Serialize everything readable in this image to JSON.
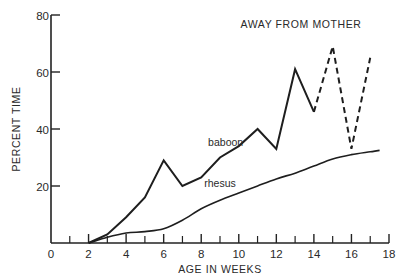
{
  "chart_data": {
    "type": "line",
    "title": "AWAY FROM MOTHER",
    "xlabel": "AGE IN WEEKS",
    "ylabel": "PERCENT TIME",
    "xlim": [
      0,
      18
    ],
    "ylim": [
      0,
      80
    ],
    "x_ticks": [
      0,
      2,
      4,
      6,
      8,
      10,
      12,
      14,
      16,
      18
    ],
    "x_minor_ticks": [
      1,
      3,
      5,
      7,
      9,
      11,
      13,
      15,
      17
    ],
    "y_ticks": [
      20,
      40,
      60,
      80
    ],
    "y_tick_labels": [
      "20",
      "40",
      "60",
      "80"
    ],
    "origin_label": "0",
    "grid": false,
    "legend": "inline labels",
    "series": [
      {
        "name": "baboon",
        "style": "solid then dashed after week 14",
        "x": [
          2,
          3,
          4,
          5,
          6,
          7,
          8,
          9,
          10,
          11,
          12,
          13,
          14,
          15,
          16,
          17
        ],
        "values": [
          0,
          3,
          9,
          16,
          29,
          20,
          23,
          30,
          34,
          40,
          33,
          61,
          46,
          69,
          33,
          65
        ],
        "solid_until_x": 14,
        "label_position": {
          "x": 9.3,
          "y": 34
        }
      },
      {
        "name": "rhesus",
        "style": "solid smooth",
        "x": [
          2,
          3,
          4,
          5,
          6,
          7,
          8,
          9,
          10,
          11,
          12,
          13,
          14,
          15,
          16,
          17,
          17.5
        ],
        "values": [
          0,
          2,
          3.5,
          4,
          5,
          8,
          12,
          15,
          17.5,
          20,
          22.5,
          24.5,
          27,
          29.5,
          31,
          32,
          32.5
        ],
        "label_position": {
          "x": 9.0,
          "y": 19.5
        }
      }
    ]
  }
}
